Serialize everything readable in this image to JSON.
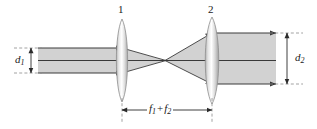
{
  "figure": {
    "type": "optical-ray-diagram",
    "background_color": "#ffffff",
    "beam_fill_color": "#d2d2d2",
    "ray_color": "#3a3a3a",
    "lens_edge_color": "#9a9a9a",
    "dashed_color": "#7a7a7a"
  },
  "labels": {
    "lens1_number": "1",
    "lens2_number": "2",
    "input_diameter": "d",
    "input_diameter_sub": "1",
    "output_diameter": "d",
    "output_diameter_sub": "2",
    "separation_f1": "f",
    "separation_f1_sub": "1",
    "separation_plus": "+",
    "separation_f2": "f",
    "separation_f2_sub": "2"
  },
  "geometry": {
    "input_beam_top_y": 48,
    "input_beam_bottom_y": 73,
    "input_beam_start_x": 38,
    "lens1_x": 122,
    "focus_x": 165,
    "lens2_x": 212,
    "output_beam_top_y": 33,
    "output_beam_bottom_y": 84,
    "output_beam_end_x": 276,
    "axis_y": 60.5,
    "dimension_line_y": 110
  }
}
